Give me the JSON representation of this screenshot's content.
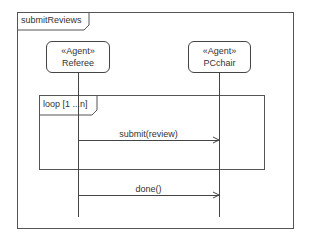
{
  "diagram": {
    "type": "UML sequence diagram",
    "frame": {
      "label": "submitReviews"
    },
    "lifelines": [
      {
        "stereotype": "«Agent»",
        "name": "Referee"
      },
      {
        "stereotype": "«Agent»",
        "name": "PCchair"
      }
    ],
    "fragments": [
      {
        "operator": "loop",
        "label": "loop [1 ...n]"
      }
    ],
    "messages": [
      {
        "label": "submit(review)",
        "from": "Referee",
        "to": "PCchair",
        "in_fragment": "loop"
      },
      {
        "label": "done()",
        "from": "Referee",
        "to": "PCchair",
        "in_fragment": null
      }
    ],
    "colors": {
      "line": "#444444",
      "text": "#333333",
      "background": "#ffffff"
    }
  }
}
